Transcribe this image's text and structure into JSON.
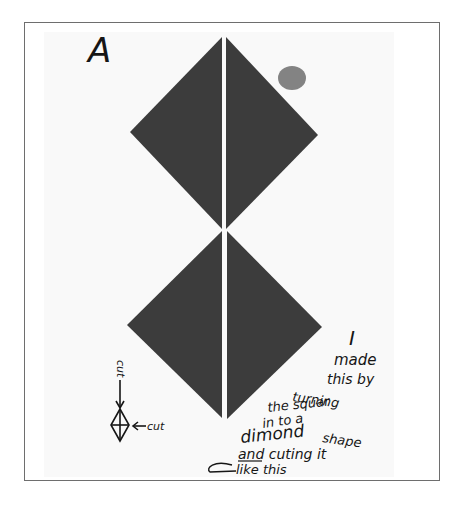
{
  "artwork": {
    "label_letter": "A",
    "fill_color": "#3c3c3c",
    "paper_color": "#f9f9f9",
    "frame_color": "#6e6e6e",
    "ink_color": "#161616",
    "top_diamond": {
      "top": [
        224,
        36
      ],
      "left": [
        130,
        132
      ],
      "right": [
        318,
        135
      ],
      "bottom": [
        224,
        230
      ]
    },
    "bottom_diamond": {
      "top": [
        224,
        230
      ],
      "left": [
        127,
        325
      ],
      "right": [
        322,
        327
      ],
      "bottom": [
        224,
        420
      ]
    }
  },
  "annotation": {
    "cut_vertical": "cut",
    "cut_horizontal": "cut",
    "lines": [
      "I",
      "made",
      "this by",
      "turning",
      "the squar",
      "in to a",
      "dimond",
      "shape",
      "and cuting it",
      "like this"
    ]
  }
}
